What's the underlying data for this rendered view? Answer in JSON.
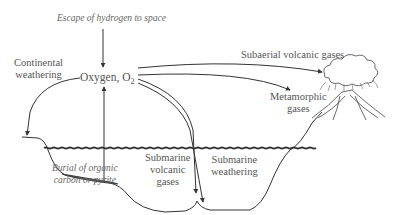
{
  "diagram": {
    "labels": {
      "escape": "Escape of hydrogen to space",
      "continental_1": "Continental",
      "continental_2": "weathering",
      "oxygen": "Oxygen, O",
      "oxygen_sub": "2",
      "subaerial": "Subaerial volcanic gases",
      "metamorphic_1": "Metamorphic",
      "metamorphic_2": "gases",
      "burial_1": "Burial of organic",
      "burial_2": "carbon or pyrite",
      "sub_volc_1": "Submarine",
      "sub_volc_2": "volcanic",
      "sub_volc_3": "gases",
      "sub_weath_1": "Submarine",
      "sub_weath_2": "weathering"
    },
    "colors": {
      "line": "#333333",
      "text": "#555555",
      "water": "#333333",
      "sediment": "#666666"
    }
  }
}
